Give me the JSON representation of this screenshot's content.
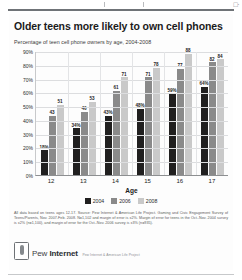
{
  "chart_data": {
    "type": "bar",
    "title": "Older teens more likely to own cell phones",
    "subtitle": "Percentage of teen cell phone owners by age, 2004-2008",
    "xlabel": "Age",
    "ylabel": "",
    "categories": [
      "12",
      "13",
      "14",
      "15",
      "16",
      "17"
    ],
    "ylim": [
      0,
      90
    ],
    "yticks": [
      "0%",
      "10%",
      "20%",
      "30%",
      "40%",
      "50%",
      "60%",
      "70%",
      "80%",
      "90%"
    ],
    "grid": true,
    "legend_position": "bottom",
    "series": [
      {
        "name": "2004",
        "color": "#201f1f",
        "values": [
          18,
          34,
          43,
          48,
          59,
          64
        ],
        "labels": [
          "18%",
          "34%",
          "43%",
          "48%",
          "59%",
          "64%"
        ]
      },
      {
        "name": "2006",
        "color": "#8a8a8a",
        "values": [
          43,
          46,
          61,
          71,
          77,
          82
        ],
        "labels": [
          "43",
          "46",
          "61",
          "71",
          "77",
          "82"
        ]
      },
      {
        "name": "2008",
        "color": "#c9c9c9",
        "values": [
          51,
          53,
          71,
          78,
          88,
          84
        ],
        "labels": [
          "51",
          "53",
          "71",
          "78",
          "88",
          "84"
        ]
      }
    ]
  },
  "footnote": "All data based on teens ages 12-17. Source: Pew Internet & American Life Project. Gaming and Civic Engagement Survey of Teens/Parents, Nov. 2007-Feb. 2008. N=1,102 and margin of error is ±2%. Margin of error for teens in the Oct.-Nov. 2004 survey is ±2% (n=1,100), and margin of error for the Oct.-Nov. 2006 survey is ±3% (n=935).",
  "logo": {
    "name_light": "Pew ",
    "name_bold": "Internet",
    "tagline": "Pew Internet & American Life Project",
    "mark": "phone-icon"
  },
  "scan": {
    "corner_mark": "□·"
  }
}
